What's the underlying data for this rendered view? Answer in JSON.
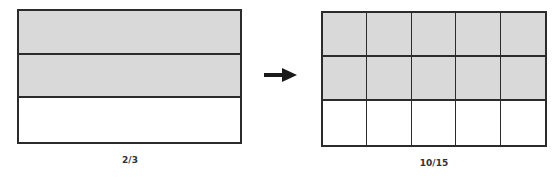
{
  "colors": {
    "shaded": "#d9d9d9",
    "unshaded": "#ffffff",
    "border": "#2b2b2b",
    "arrow": "#1a1a1a"
  },
  "left_diagram": {
    "label": "2/3",
    "rows": 3,
    "cols": 1,
    "shaded_rows": 2
  },
  "right_diagram": {
    "label": "10/15",
    "rows": 3,
    "cols": 5,
    "shaded_rows": 2
  },
  "arrow": {
    "icon": "right-arrow-icon",
    "direction": "right"
  }
}
